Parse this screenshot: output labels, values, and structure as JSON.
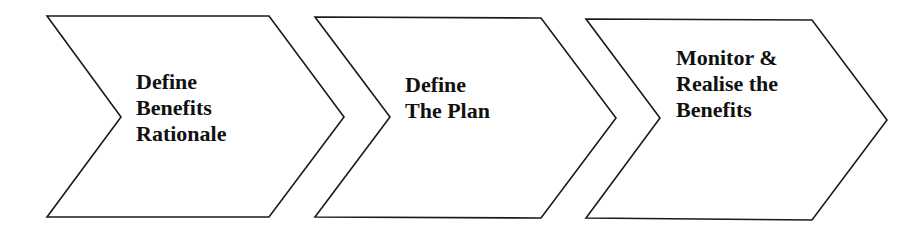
{
  "diagram": {
    "type": "chevron-process",
    "stroke_color": "#1a1a1a",
    "fill_color": "#ffffff",
    "steps": [
      {
        "lines": [
          "Define",
          "Benefits",
          "Rationale"
        ]
      },
      {
        "lines": [
          "Define",
          "The Plan"
        ]
      },
      {
        "lines": [
          "Monitor &",
          "Realise the",
          "Benefits"
        ]
      }
    ]
  }
}
